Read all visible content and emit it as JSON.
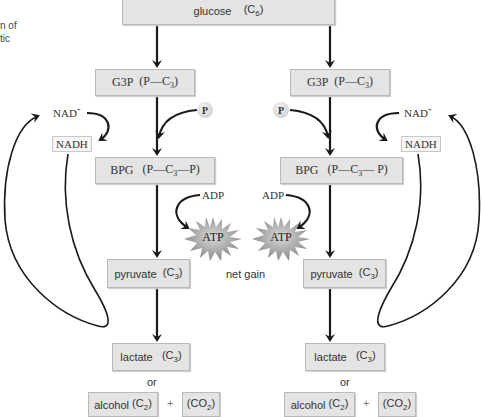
{
  "caption_fragment": [
    "n of",
    "tic"
  ],
  "glucose": {
    "name": "glucose",
    "formula": "(C",
    "sub": "6",
    "close": ")"
  },
  "left": {
    "g3p": {
      "name": "G3P",
      "formula_a": "(P—C",
      "sub": "3",
      "formula_b": ")"
    },
    "bpg": {
      "name": "BPG",
      "formula_a": "(P—C",
      "sub": "3",
      "formula_b": "—P)"
    },
    "pyruvate": {
      "name": "pyruvate",
      "formula_a": "(C",
      "sub": "3",
      "formula_b": ")"
    },
    "lactate": {
      "name": "lactate",
      "formula_a": "(C",
      "sub": "3",
      "formula_b": ")"
    },
    "or": "or",
    "alcohol": {
      "name": "alcohol",
      "formula_a": "(C",
      "sub": "2",
      "formula_b": ")"
    },
    "plus": "+",
    "co2": {
      "formula_a": "(CO",
      "sub": "2",
      "formula_b": ")"
    },
    "nad_plus": {
      "base": "NAD",
      "sup": "+"
    },
    "nadh": "NADH",
    "phosphate": "P",
    "adp": "ADP",
    "atp": "ATP"
  },
  "right": {
    "g3p": {
      "name": "G3P",
      "formula_a": "(P—C",
      "sub": "3",
      "formula_b": ")"
    },
    "bpg": {
      "name": "BPG",
      "formula_a": "(P—C",
      "sub": "3",
      "formula_b": "— P)"
    },
    "pyruvate": {
      "name": "pyruvate",
      "formula_a": "(C",
      "sub": "3",
      "formula_b": ")"
    },
    "lactate": {
      "name": "lactate",
      "formula_a": "(C",
      "sub": "3",
      "formula_b": ")"
    },
    "or": "or",
    "alcohol": {
      "name": "alcohol",
      "formula_a": "(C",
      "sub": "2",
      "formula_b": ")"
    },
    "plus": "+",
    "co2": {
      "formula_a": "(CO",
      "sub": "2",
      "formula_b": ")"
    },
    "nad_plus": {
      "base": "NAD",
      "sup": "+"
    },
    "nadh": "NADH",
    "phosphate": "P",
    "adp": "ADP",
    "atp": "ATP"
  },
  "net_gain": "net gain",
  "colors": {
    "box_fill": "#e4e4e4",
    "box_border": "#b9b9b9",
    "arrow": "#1a1a1a",
    "text": "#333333"
  }
}
